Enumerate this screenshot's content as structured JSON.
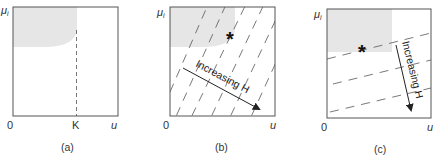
{
  "colors": {
    "frame": "#555555",
    "shade": "#e6e6e6",
    "dash": "#555555",
    "text": "#333333"
  },
  "panels": [
    {
      "id": "a",
      "caption": "(a)",
      "y_axis_label": "μ",
      "y_axis_subscript": "i",
      "origin_label": "0",
      "x_axis_label": "u",
      "tick_label": "K"
    },
    {
      "id": "b",
      "caption": "(b)",
      "y_axis_label": "μ",
      "y_axis_subscript": "i",
      "origin_label": "0",
      "x_axis_label": "u",
      "marker": "*",
      "arrow_label": "Increasing H"
    },
    {
      "id": "c",
      "caption": "(c)",
      "y_axis_label": "μ",
      "y_axis_subscript": "i",
      "origin_label": "0",
      "x_axis_label": "u",
      "marker": "*",
      "arrow_label": "Increasing H"
    }
  ]
}
